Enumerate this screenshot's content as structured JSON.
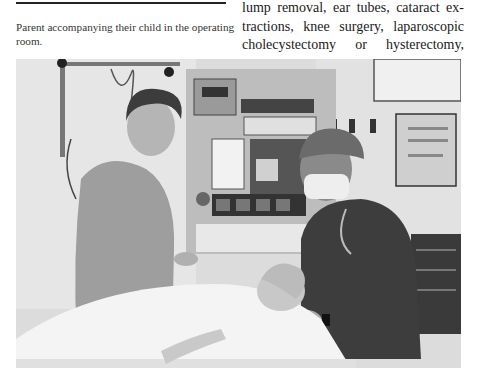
{
  "figure": {
    "caption": "Parent accompanying their child in the operating room.",
    "photo_alt": "Black and white photo: a parent in a polo shirt stands beside a child lying on an operating table covered in a white sheet, while an anesthesiologist in a surgical cap, mask and stethoscope sits at the head of the table in front of an anesthesia machine."
  },
  "body_text": {
    "lines": [
      "lump removal, ear tubes, cataract ex-",
      "tractions, knee surgery, laparoscopic",
      "cholecystectomy or hysterectomy,"
    ]
  }
}
